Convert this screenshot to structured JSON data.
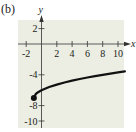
{
  "figure_label": "(b)",
  "colors": {
    "plot_background": "#eceee3",
    "axis": "#333333",
    "curve": "#111111"
  },
  "chart_data": {
    "type": "line",
    "title": "",
    "xlabel": "x",
    "ylabel": "y",
    "xlim": [
      -2.9,
      10.9
    ],
    "ylim": [
      -10.9,
      3.1
    ],
    "grid": false,
    "legend": null,
    "x_ticks": [
      -2,
      2,
      4,
      6,
      8,
      10
    ],
    "y_ticks": [
      2,
      -4,
      -8,
      -10
    ],
    "x_tick_labels": [
      "-2",
      "2",
      "4",
      "6",
      "8",
      "10"
    ],
    "y_tick_labels": [
      "2",
      "-4",
      "-8",
      "-10"
    ],
    "series": [
      {
        "name": "y = sqrt(x+1) - 7",
        "start_point": {
          "x": -1,
          "y": -7,
          "marker": "filled-circle"
        },
        "x": [
          -1,
          -0.75,
          -0.5,
          0,
          1,
          2,
          3,
          4,
          5,
          6,
          7,
          8,
          9,
          10,
          10.9
        ],
        "y": [
          -7,
          -6.5,
          -6.29,
          -6,
          -5.59,
          -5.27,
          -5,
          -4.76,
          -4.55,
          -4.35,
          -4.17,
          -4,
          -3.84,
          -3.68,
          -3.55
        ]
      }
    ]
  }
}
